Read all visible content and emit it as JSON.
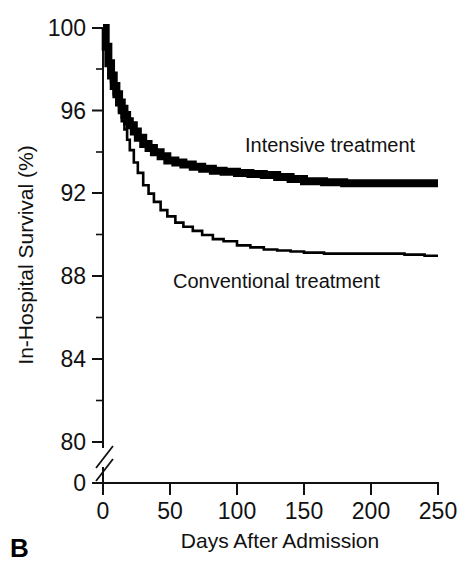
{
  "panel": {
    "label": "B"
  },
  "chart_data": {
    "type": "line",
    "title": "",
    "subtitle": "",
    "xlabel": "Days After Admission",
    "ylabel": "In-Hospital Survival (%)",
    "xlim": [
      0,
      250
    ],
    "ylim": [
      80,
      100
    ],
    "grid": false,
    "legend_position": "inline-annotations",
    "axis_break": {
      "axis": "y",
      "from": 0,
      "to": 80,
      "note": "broken y-axis between 0 and 80"
    },
    "x_ticks": [
      0,
      50,
      100,
      150,
      200,
      250
    ],
    "x_tick_labels": [
      "0",
      "50",
      "100",
      "150",
      "200",
      "250"
    ],
    "y_ticks": [
      0,
      80,
      84,
      88,
      92,
      96,
      100
    ],
    "y_tick_labels": [
      "0",
      "80",
      "84",
      "88",
      "92",
      "96",
      "100"
    ],
    "y_minor_ticks": [
      82,
      86,
      90,
      94,
      98
    ],
    "series": [
      {
        "name": "Intensive treatment",
        "style": "thick-step",
        "annotation": "Intensive treatment",
        "final_value": 92.5,
        "x": [
          0,
          2,
          4,
          6,
          8,
          10,
          12,
          14,
          16,
          18,
          20,
          23,
          26,
          30,
          34,
          38,
          43,
          48,
          54,
          60,
          67,
          74,
          82,
          90,
          100,
          110,
          120,
          130,
          140,
          150,
          165,
          180,
          200,
          220,
          250
        ],
        "values": [
          100.0,
          99.1,
          98.3,
          97.7,
          97.2,
          96.8,
          96.4,
          96.1,
          95.8,
          95.5,
          95.3,
          95.0,
          94.7,
          94.4,
          94.2,
          94.0,
          93.8,
          93.6,
          93.5,
          93.4,
          93.3,
          93.2,
          93.1,
          93.05,
          93.0,
          92.95,
          92.9,
          92.8,
          92.7,
          92.6,
          92.55,
          92.5,
          92.5,
          92.5,
          92.5
        ]
      },
      {
        "name": "Conventional treatment",
        "style": "thin-step",
        "annotation": "Conventional treatment",
        "final_value": 89.0,
        "x": [
          0,
          2,
          4,
          6,
          8,
          10,
          12,
          14,
          16,
          18,
          20,
          23,
          26,
          30,
          34,
          38,
          43,
          48,
          54,
          60,
          67,
          74,
          82,
          90,
          100,
          110,
          120,
          130,
          140,
          150,
          165,
          180,
          195,
          210,
          225,
          240,
          250
        ],
        "values": [
          100.0,
          99.0,
          98.1,
          97.4,
          96.8,
          96.3,
          95.9,
          95.5,
          95.1,
          94.6,
          94.1,
          93.5,
          93.0,
          92.4,
          92.0,
          91.6,
          91.2,
          90.9,
          90.6,
          90.4,
          90.2,
          90.0,
          89.8,
          89.7,
          89.5,
          89.4,
          89.3,
          89.25,
          89.2,
          89.15,
          89.1,
          89.1,
          89.1,
          89.1,
          89.05,
          89.0,
          89.0
        ]
      }
    ],
    "annotations": [
      {
        "text": "Intensive treatment",
        "x": 110,
        "y": 94.7
      },
      {
        "text": "Conventional treatment",
        "x": 50,
        "y": 88.2
      }
    ]
  }
}
